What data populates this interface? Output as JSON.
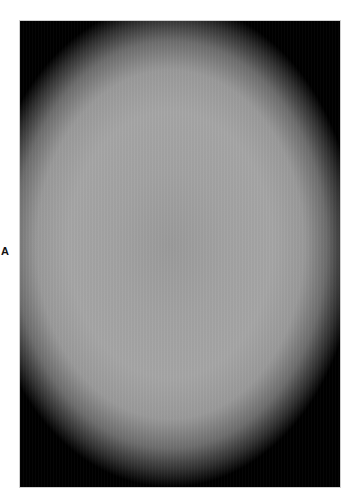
{
  "figure": {
    "panel_label": "A",
    "image": {
      "description": "grayscale vignetted microscopy-style image: light gray central ellipse fading to black corners",
      "center_color": "#9b9b9b",
      "mid_color": "#a6a6a6",
      "edge_color": "#000000",
      "border_color": "#d0d0d0"
    }
  }
}
